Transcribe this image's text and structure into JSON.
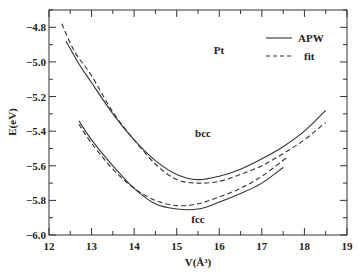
{
  "chart_data": {
    "type": "line",
    "title": "",
    "xlabel": "V(Å³)",
    "ylabel": "E(eV)",
    "xlim": [
      12,
      19
    ],
    "ylim": [
      -6.0,
      -4.7
    ],
    "x_ticks": [
      "12",
      "13",
      "14",
      "15",
      "16",
      "17",
      "18",
      "19"
    ],
    "y_ticks": [
      "-4.8",
      "-5.0",
      "-5.2",
      "-5.4",
      "-5.6",
      "-5.8",
      "-6.0"
    ],
    "grid": false,
    "legend": {
      "position": "upper right",
      "entries": [
        {
          "label": "APW",
          "style": "solid"
        },
        {
          "label": "fit",
          "style": "dashed"
        }
      ]
    },
    "annotations": [
      {
        "text": "Pt",
        "x": 15.3,
        "y": -5.0
      },
      {
        "text": "bcc",
        "x": 15.3,
        "y": -5.6
      },
      {
        "text": "fcc",
        "x": 15.2,
        "y": -5.94
      }
    ],
    "series": [
      {
        "name": "bcc APW",
        "style": "solid",
        "x": [
          12.4,
          12.7,
          13.0,
          13.5,
          14.0,
          14.5,
          15.0,
          15.5,
          16.0,
          16.5,
          17.0,
          17.5,
          18.0,
          18.5
        ],
        "y": [
          -4.88,
          -5.01,
          -5.12,
          -5.3,
          -5.45,
          -5.57,
          -5.65,
          -5.68,
          -5.66,
          -5.62,
          -5.56,
          -5.49,
          -5.4,
          -5.28
        ]
      },
      {
        "name": "bcc fit",
        "style": "dashed",
        "x": [
          12.3,
          12.6,
          13.0,
          13.5,
          14.0,
          14.5,
          15.0,
          15.5,
          16.0,
          16.5,
          17.0,
          17.5,
          18.0,
          18.5
        ],
        "y": [
          -4.78,
          -4.94,
          -5.08,
          -5.29,
          -5.45,
          -5.59,
          -5.68,
          -5.7,
          -5.69,
          -5.65,
          -5.6,
          -5.53,
          -5.45,
          -5.35
        ]
      },
      {
        "name": "fcc APW",
        "style": "solid",
        "x": [
          12.7,
          13.0,
          13.5,
          14.0,
          14.5,
          15.0,
          15.5,
          16.0,
          16.5,
          17.0,
          17.5
        ],
        "y": [
          -5.34,
          -5.45,
          -5.6,
          -5.73,
          -5.82,
          -5.85,
          -5.85,
          -5.81,
          -5.76,
          -5.7,
          -5.61
        ]
      },
      {
        "name": "fcc fit",
        "style": "dashed",
        "x": [
          12.7,
          13.0,
          13.5,
          14.0,
          14.5,
          15.0,
          15.5,
          16.0,
          16.5,
          17.0,
          17.6
        ],
        "y": [
          -5.36,
          -5.47,
          -5.62,
          -5.73,
          -5.8,
          -5.83,
          -5.82,
          -5.78,
          -5.73,
          -5.66,
          -5.55
        ]
      }
    ]
  },
  "colors": {
    "line": "#333333",
    "axis": "#333333"
  }
}
